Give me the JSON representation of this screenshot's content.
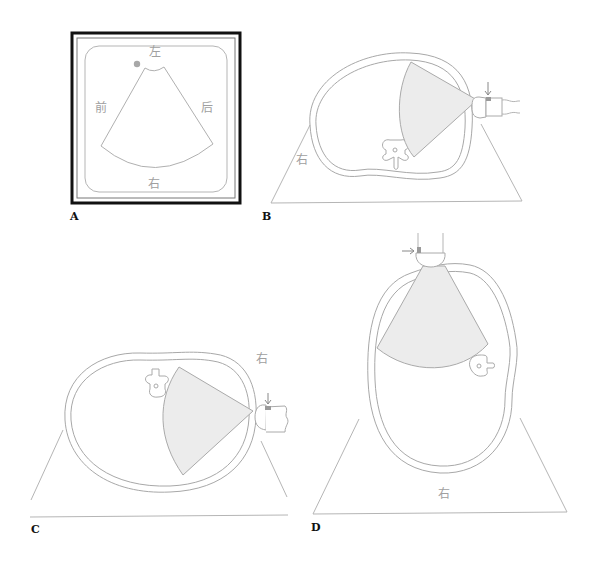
{
  "figure": {
    "panels": [
      {
        "id": "A",
        "label": "A",
        "description": "Ultrasound display screen with sector image and orientation labels",
        "orientation_labels": {
          "top": "左",
          "left": "前",
          "right": "后",
          "bottom": "右"
        }
      },
      {
        "id": "B",
        "label": "B",
        "description": "Cross-section of body with probe placed on left side, sector beam directed inward",
        "side_label": "右"
      },
      {
        "id": "C",
        "label": "C",
        "description": "Cross-section of body, patient rotated, probe on lateral side",
        "side_label": "右"
      },
      {
        "id": "D",
        "label": "D",
        "description": "Cross-section of body in lateral decubitus, probe placed from above",
        "side_label": "右"
      }
    ]
  }
}
